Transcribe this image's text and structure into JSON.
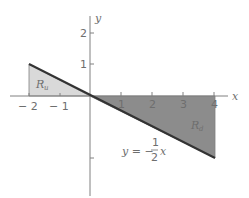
{
  "axes": {
    "x_label": "x",
    "y_label": "y",
    "x_ticks": [
      {
        "value": -2,
        "label": "− 2"
      },
      {
        "value": -1,
        "label": "− 1"
      },
      {
        "value": 1,
        "label": "1"
      },
      {
        "value": 2,
        "label": "2"
      },
      {
        "value": 3,
        "label": "3"
      },
      {
        "value": 4,
        "label": "4"
      }
    ],
    "y_ticks": [
      {
        "value": 1,
        "label": "1"
      },
      {
        "value": 2,
        "label": "2"
      }
    ]
  },
  "regions": {
    "upper": {
      "label": "R",
      "subscript": "u",
      "color": "#d9d9d9",
      "vertices": [
        [
          -2,
          1
        ],
        [
          -2,
          0
        ],
        [
          0,
          0
        ]
      ]
    },
    "lower": {
      "label": "R",
      "subscript": "d",
      "color": "#8c8c8c",
      "vertices": [
        [
          0,
          0
        ],
        [
          4,
          0
        ],
        [
          4,
          -2
        ]
      ]
    }
  },
  "curve": {
    "equation_prefix": "y = −",
    "frac_num": "1",
    "frac_den": "2",
    "equation_suffix": "x",
    "x_range": [
      -2,
      4
    ]
  },
  "colors": {
    "axis": "#808080",
    "line": "#333333",
    "text": "#6e6e6e"
  }
}
